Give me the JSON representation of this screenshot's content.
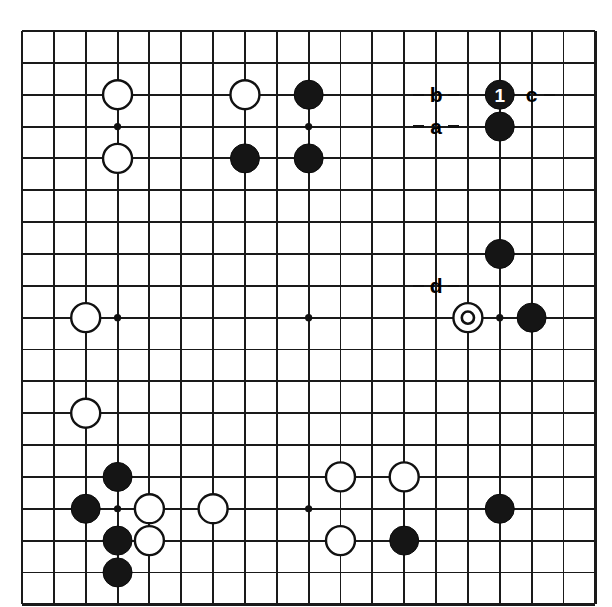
{
  "diagram": {
    "kind": "go-board-diagram",
    "board_size": 19,
    "background_color": "#ffffff",
    "line_color": "#1a1a1a",
    "black_stone_color": "#151515",
    "white_stone_color": "#ffffff"
  },
  "geometry": {
    "origin_x": 22,
    "origin_y": 31,
    "spacing": 31.85,
    "stone_radius": 14.5,
    "star_radius": 3.6
  },
  "star_points": [
    {
      "col": 3,
      "row": 3
    },
    {
      "col": 9,
      "row": 3
    },
    {
      "col": 15,
      "row": 3
    },
    {
      "col": 3,
      "row": 9
    },
    {
      "col": 9,
      "row": 9
    },
    {
      "col": 15,
      "row": 9
    },
    {
      "col": 3,
      "row": 15
    },
    {
      "col": 9,
      "row": 15
    },
    {
      "col": 15,
      "row": 15
    }
  ],
  "stones": [
    {
      "col": 3,
      "row": 2,
      "color": "white",
      "label": "",
      "mark": ""
    },
    {
      "col": 7,
      "row": 2,
      "color": "white",
      "label": "",
      "mark": ""
    },
    {
      "col": 9,
      "row": 2,
      "color": "black",
      "label": "",
      "mark": ""
    },
    {
      "col": 15,
      "row": 2,
      "color": "black",
      "label": "1",
      "mark": ""
    },
    {
      "col": 15,
      "row": 3,
      "color": "black",
      "label": "",
      "mark": ""
    },
    {
      "col": 3,
      "row": 4,
      "color": "white",
      "label": "",
      "mark": ""
    },
    {
      "col": 7,
      "row": 4,
      "color": "black",
      "label": "",
      "mark": ""
    },
    {
      "col": 9,
      "row": 4,
      "color": "black",
      "label": "",
      "mark": ""
    },
    {
      "col": 15,
      "row": 7,
      "color": "black",
      "label": "",
      "mark": ""
    },
    {
      "col": 2,
      "row": 9,
      "color": "white",
      "label": "",
      "mark": ""
    },
    {
      "col": 14,
      "row": 9,
      "color": "white",
      "label": "",
      "mark": "circle"
    },
    {
      "col": 16,
      "row": 9,
      "color": "black",
      "label": "",
      "mark": ""
    },
    {
      "col": 2,
      "row": 12,
      "color": "white",
      "label": "",
      "mark": ""
    },
    {
      "col": 3,
      "row": 14,
      "color": "black",
      "label": "",
      "mark": ""
    },
    {
      "col": 10,
      "row": 14,
      "color": "white",
      "label": "",
      "mark": ""
    },
    {
      "col": 12,
      "row": 14,
      "color": "white",
      "label": "",
      "mark": ""
    },
    {
      "col": 2,
      "row": 15,
      "color": "black",
      "label": "",
      "mark": ""
    },
    {
      "col": 4,
      "row": 15,
      "color": "white",
      "label": "",
      "mark": ""
    },
    {
      "col": 6,
      "row": 15,
      "color": "white",
      "label": "",
      "mark": ""
    },
    {
      "col": 15,
      "row": 15,
      "color": "black",
      "label": "",
      "mark": ""
    },
    {
      "col": 3,
      "row": 16,
      "color": "black",
      "label": "",
      "mark": ""
    },
    {
      "col": 4,
      "row": 16,
      "color": "white",
      "label": "",
      "mark": ""
    },
    {
      "col": 10,
      "row": 16,
      "color": "white",
      "label": "",
      "mark": ""
    },
    {
      "col": 12,
      "row": 16,
      "color": "black",
      "label": "",
      "mark": ""
    },
    {
      "col": 3,
      "row": 17,
      "color": "black",
      "label": "",
      "mark": ""
    }
  ],
  "point_labels": [
    {
      "text": "b",
      "col": 13,
      "row": 2,
      "leader": "both"
    },
    {
      "text": "c",
      "col": 16,
      "row": 2,
      "leader": "right"
    },
    {
      "text": "a",
      "col": 13,
      "row": 3,
      "leader": "both"
    },
    {
      "text": "d",
      "col": 13,
      "row": 8,
      "leader": "both"
    }
  ]
}
